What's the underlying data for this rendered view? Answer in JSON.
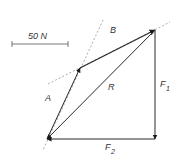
{
  "diagram": {
    "type": "vector-addition",
    "scale_bar": {
      "label": "50 N",
      "x1": 12,
      "x2": 68,
      "y": 44
    },
    "colors": {
      "line": "#2a2a2a",
      "dashed": "#888888",
      "text": "#333333"
    },
    "points": {
      "origin": [
        47,
        139
      ],
      "a_tip": [
        80,
        68
      ],
      "b_tip": [
        155,
        30
      ],
      "f1_tip": [
        155,
        139
      ]
    },
    "vectors": [
      {
        "name": "A",
        "label": "A",
        "from": [
          47,
          139
        ],
        "to": [
          80,
          68
        ]
      },
      {
        "name": "B",
        "label": "B",
        "from": [
          80,
          68
        ],
        "to": [
          155,
          30
        ]
      },
      {
        "name": "R",
        "label": "R",
        "from": [
          155,
          30
        ],
        "to": [
          47,
          139
        ]
      },
      {
        "name": "F1",
        "label": "F",
        "sub": "1",
        "from": [
          155,
          30
        ],
        "to": [
          155,
          139
        ]
      },
      {
        "name": "F2",
        "label": "F",
        "sub": "2",
        "from": [
          155,
          139
        ],
        "to": [
          47,
          139
        ]
      }
    ],
    "dashed_lines": [
      {
        "from": [
          103,
          20
        ],
        "to": [
          43,
          150
        ]
      },
      {
        "from": [
          48,
          84
        ],
        "to": [
          170,
          22
        ]
      }
    ],
    "labels": {
      "A": "A",
      "B": "B",
      "R": "R",
      "F1_main": "F",
      "F1_sub": "1",
      "F2_main": "F",
      "F2_sub": "2"
    }
  }
}
